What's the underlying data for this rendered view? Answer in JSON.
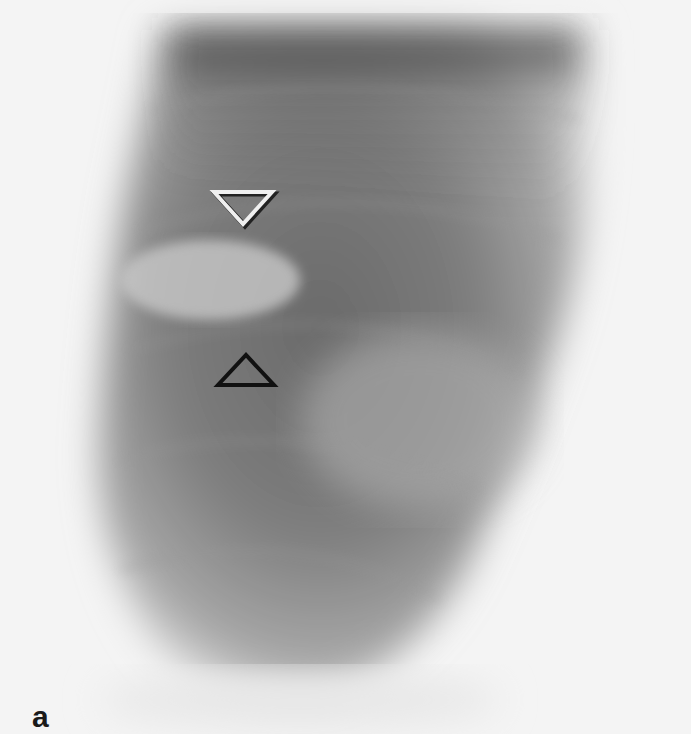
{
  "figure": {
    "panel_label": "a",
    "markers": [
      {
        "type": "triangle-down",
        "color": "white-outlined",
        "x": 243,
        "y": 207
      },
      {
        "type": "triangle-up",
        "color": "black-outlined",
        "x": 246,
        "y": 372
      }
    ]
  }
}
